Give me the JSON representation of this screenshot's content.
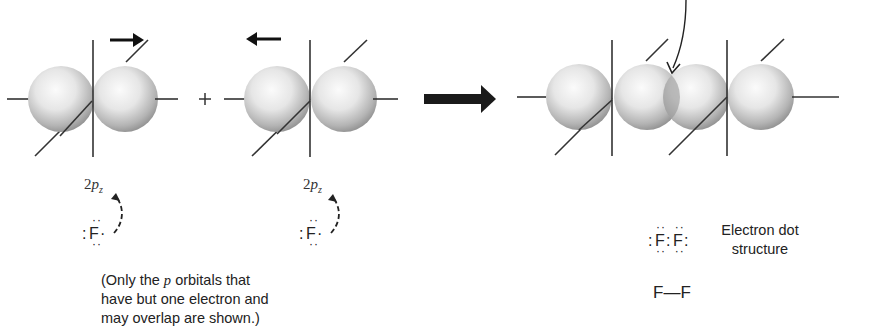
{
  "figure": {
    "atom_left": {
      "orbital_label": {
        "prefix": "2",
        "letter": "p",
        "subscript": "z"
      },
      "lewis": {
        "symbol": "F",
        "left_dots": ":",
        "right_dot": "·",
        "top_dots": "··",
        "bottom_dots": "··"
      },
      "motion_arrow": "right"
    },
    "plus_sign": "+",
    "atom_right": {
      "orbital_label": {
        "prefix": "2",
        "letter": "p",
        "subscript": "z"
      },
      "lewis": {
        "symbol": "F",
        "left_dots": ":",
        "right_dot": "·",
        "top_dots": "··",
        "bottom_dots": "··"
      },
      "motion_arrow": "left"
    },
    "reaction_arrow": "bold-right-arrow",
    "product": {
      "description": "overlapping p orbitals forming F–F sigma bond",
      "overlap_pointer": "curved-arrow-to-overlap-region",
      "electron_dot_structure": {
        "left": "F",
        "right": "F",
        "label_line1": "Electron dot",
        "label_line2": "structure"
      },
      "bond_line_structure": "F—F"
    },
    "note": {
      "line1_before": "(Only the ",
      "line1_italic": "p",
      "line1_after": " orbitals that",
      "line2": "have but one electron and",
      "line3": "may overlap are shown.)"
    },
    "colors": {
      "lobe_light": "#f4f4f4",
      "lobe_dark": "#8a8a8a",
      "overlap": "#9a9a9a",
      "ink": "#222222"
    }
  }
}
